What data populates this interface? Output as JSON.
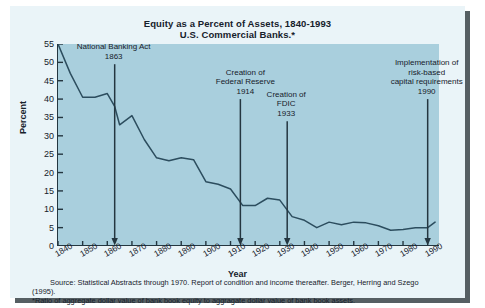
{
  "chart_data": {
    "type": "line",
    "title": "Equity as a Percent of Assets, 1840-1993",
    "subtitle": "U.S. Commercial Banks.*",
    "xlabel": "Year",
    "ylabel": "Percent",
    "ylim": [
      0,
      55
    ],
    "xlim": [
      1840,
      1995
    ],
    "grid": false,
    "legend": "none",
    "ytick_labels": [
      "0",
      "5",
      "10",
      "15",
      "20",
      "25",
      "30",
      "35",
      "40",
      "45",
      "50",
      "55"
    ],
    "ytick_values": [
      0,
      5,
      10,
      15,
      20,
      25,
      30,
      35,
      40,
      45,
      50,
      55
    ],
    "xtick_labels": [
      "1840",
      "1850",
      "1860",
      "1870",
      "1880",
      "1890",
      "1900",
      "1910",
      "1920",
      "1930",
      "1940",
      "1950",
      "1960",
      "1970",
      "1980",
      "1990"
    ],
    "xtick_values": [
      1840,
      1850,
      1860,
      1870,
      1880,
      1890,
      1900,
      1910,
      1920,
      1930,
      1940,
      1950,
      1960,
      1970,
      1980,
      1990
    ],
    "series": [
      {
        "name": "Equity as a percent of assets",
        "color": "#2c4d5e",
        "x": [
          1840,
          1845,
          1850,
          1855,
          1860,
          1863,
          1865,
          1870,
          1875,
          1880,
          1885,
          1890,
          1895,
          1900,
          1905,
          1910,
          1915,
          1920,
          1925,
          1930,
          1935,
          1940,
          1945,
          1950,
          1955,
          1960,
          1965,
          1970,
          1975,
          1980,
          1985,
          1990,
          1993
        ],
        "y": [
          55.0,
          47.0,
          40.5,
          40.5,
          41.5,
          38.0,
          33.0,
          35.5,
          29.0,
          24.0,
          23.2,
          24.0,
          23.5,
          17.5,
          16.8,
          15.5,
          11.0,
          11.0,
          13.0,
          12.5,
          8.0,
          7.0,
          5.0,
          6.5,
          5.8,
          6.5,
          6.3,
          5.5,
          4.3,
          4.5,
          5.0,
          5.0,
          6.5
        ]
      }
    ],
    "annotations": [
      {
        "id": "national-banking-act",
        "lines": [
          "National Banking Act",
          "1863"
        ],
        "year": 1863,
        "arrow_top_percent": 49.5
      },
      {
        "id": "creation-of-federal-reserve",
        "lines": [
          "Creation of",
          "Federal Reserve",
          "1914"
        ],
        "year": 1914,
        "arrow_top_percent": 40.0
      },
      {
        "id": "creation-of-fdic",
        "lines": [
          "Creation of",
          "FDIC",
          "1933"
        ],
        "year": 1933,
        "arrow_top_percent": 34.0
      },
      {
        "id": "risk-based-capital",
        "lines": [
          "Implementation of",
          "risk-based",
          "capital requirements",
          "1990"
        ],
        "year": 1990,
        "arrow_top_percent": 40.0
      }
    ]
  },
  "notes": {
    "source": "Source: Statistical Abstracts through 1970.  Report of condition and income thereafter. Berger, Herring and Szego (1995).",
    "footnote": "*Ratio of aggregate dollar value of bank book equity to aggragate dollar value of bank book assets."
  },
  "colors": {
    "panel_background": "#a9cfdd",
    "figure_background": "#eaf4f8",
    "line": "#2c4d5e",
    "axis": "#243640",
    "text": "#16212b"
  }
}
